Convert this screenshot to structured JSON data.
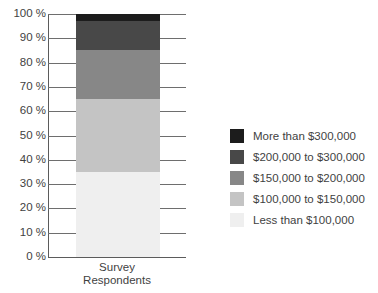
{
  "chart_data": {
    "type": "bar",
    "subtype": "stacked-bar-100pct",
    "title": "",
    "xlabel": "Survey Respondents",
    "ylabel": "",
    "categories": [
      "Survey Respondents"
    ],
    "ylim": [
      0,
      100
    ],
    "y_unit": "%",
    "grid": true,
    "legend_position": "right",
    "y_tick_labels": [
      "100 %",
      "90 %",
      "80 %",
      "70 %",
      "60 %",
      "50 %",
      "40 %",
      "30 %",
      "20 %",
      "10 %",
      "0 %"
    ],
    "y_tick_values": [
      100,
      90,
      80,
      70,
      60,
      50,
      40,
      30,
      20,
      10,
      0
    ],
    "series": [
      {
        "name": "More than $300,000",
        "values": [
          3
        ],
        "color": "#1c1c1c"
      },
      {
        "name": "$200,000 to $300,000",
        "values": [
          12
        ],
        "color": "#484848"
      },
      {
        "name": "$150,000 to $200,000",
        "values": [
          20
        ],
        "color": "#878787"
      },
      {
        "name": "$100,000 to $150,000",
        "values": [
          30
        ],
        "color": "#c4c4c4"
      },
      {
        "name": "Less than $100,000",
        "values": [
          35
        ],
        "color": "#efefef"
      }
    ],
    "stack_boundaries_pct": [
      35,
      65,
      85,
      97,
      100
    ]
  },
  "axis": {
    "x_category_line1": "Survey",
    "x_category_line2": "Respondents"
  },
  "legend": {
    "items": [
      {
        "label": "More than $300,000",
        "color": "#1c1c1c"
      },
      {
        "label": "$200,000 to $300,000",
        "color": "#484848"
      },
      {
        "label": "$150,000 to $200,000",
        "color": "#878787"
      },
      {
        "label": "$100,000 to $150,000",
        "color": "#c4c4c4"
      },
      {
        "label": "Less than $100,000",
        "color": "#efefef"
      }
    ]
  }
}
